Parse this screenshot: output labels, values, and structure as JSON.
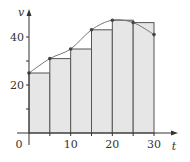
{
  "chart_data": {
    "type": "bar",
    "subtype": "left-endpoint Riemann rectangles under a curve",
    "title": "",
    "xlabel": "t",
    "ylabel": "v",
    "xlim": [
      0,
      30
    ],
    "ylim": [
      0,
      48
    ],
    "x_ticks": [
      0,
      10,
      20,
      30
    ],
    "x_tick_labels": [
      "0",
      "10",
      "20",
      "30"
    ],
    "x_minor_ticks": [
      5,
      15,
      25
    ],
    "y_ticks": [
      10,
      20,
      30,
      40
    ],
    "y_tick_labels": [
      "",
      "20",
      "",
      "40"
    ],
    "grid": false,
    "legend": null,
    "bars": {
      "left_edges": [
        0,
        5,
        10,
        15,
        20,
        25
      ],
      "width": 5,
      "heights": [
        25,
        31,
        35,
        43,
        47,
        46
      ]
    },
    "curve_points": {
      "x": [
        0,
        5,
        10,
        15,
        20,
        25,
        30
      ],
      "y": [
        25,
        31,
        35,
        43,
        47,
        46,
        41
      ]
    },
    "colors": {
      "bar_fill": "#e6e6e6",
      "bar_stroke": "#555555",
      "curve": "#777777",
      "point": "#444444",
      "axis": "#333333"
    }
  },
  "labels": {
    "origin": "0",
    "x_axis": "t",
    "y_axis": "v"
  }
}
